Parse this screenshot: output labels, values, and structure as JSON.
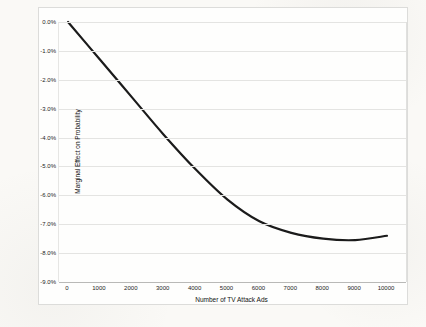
{
  "chart": {
    "y_axis_title": "Marginal Effect on Probability",
    "x_axis_title": "Number of TV Attack Ads"
  },
  "chart_data": {
    "type": "line",
    "title": "",
    "xlabel": "Number of TV Attack Ads",
    "ylabel": "Marginal Effect on Probability",
    "x": [
      0,
      1000,
      2000,
      3000,
      4000,
      5000,
      6000,
      7000,
      8000,
      9000,
      10000
    ],
    "values": [
      0.0,
      -1.3,
      -2.6,
      -3.9,
      -5.1,
      -6.15,
      -6.9,
      -7.3,
      -7.5,
      -7.55,
      -7.4
    ],
    "values_unit": "percent",
    "xlim": [
      0,
      10000
    ],
    "ylim": [
      -9.0,
      0.0
    ],
    "x_tick_labels": [
      "0",
      "1000",
      "2000",
      "3000",
      "4000",
      "5000",
      "6000",
      "7000",
      "8000",
      "9000",
      "10000"
    ],
    "y_tick_labels": [
      "0.0%",
      "-1.0%",
      "-2.0%",
      "-3.0%",
      "-4.0%",
      "-5.0%",
      "-6.0%",
      "-7.0%",
      "-8.0%",
      "-9.0%"
    ],
    "grid": "horizontal",
    "legend": "none",
    "line_color": "#1b1b1b",
    "gridline_color": "#e4e4e2",
    "plot_background": "#fefefd"
  }
}
